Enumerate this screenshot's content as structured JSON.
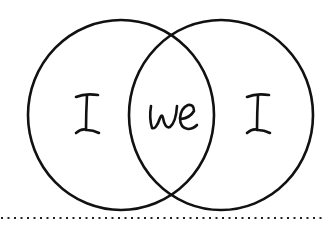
{
  "diagram": {
    "type": "venn",
    "colors": {
      "stroke": "#111111",
      "background": "#ffffff",
      "text": "#1a1a1a"
    },
    "circles": [
      {
        "id": "left",
        "cx": 121,
        "cy": 115,
        "rx": 93,
        "ry": 95
      },
      {
        "id": "right",
        "cx": 221,
        "cy": 115,
        "rx": 92,
        "ry": 95
      }
    ],
    "labels": {
      "left": "I",
      "intersection": "we",
      "right": "I"
    },
    "divider": {
      "style": "dotted",
      "y": 218,
      "x_start": 1,
      "x_end": 322
    }
  }
}
